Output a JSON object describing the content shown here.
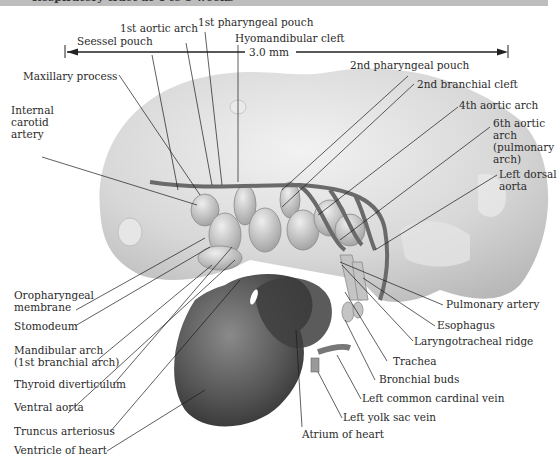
{
  "header": {
    "title": "Respiratory tract at 4 to 5 weeks"
  },
  "scale": {
    "label": "3.0 mm"
  },
  "labels": {
    "first_aortic_arch": "1st aortic arch",
    "first_pharyngeal_pouch": "1st pharyngeal pouch",
    "seessel_pouch": "Seessel pouch",
    "hyomandibular_cleft": "Hyomandibular cleft",
    "maxillary_process": "Maxillary process",
    "internal_carotid_artery": [
      "Internal",
      "carotid",
      "artery"
    ],
    "second_pharyngeal_pouch": "2nd pharyngeal pouch",
    "second_branchial_cleft": "2nd branchial cleft",
    "fourth_aortic_arch": "4th aortic arch",
    "sixth_aortic_arch": [
      "6th aortic",
      "arch",
      "(pulmonary",
      "arch)"
    ],
    "left_dorsal_aorta": [
      "Left dorsal",
      "aorta"
    ],
    "oropharyngeal_membrane": [
      "Oropharyngeal",
      "membrane"
    ],
    "stomodeum": "Stomodeum",
    "mandibular_arch": [
      "Mandibular arch",
      "(1st branchial arch)"
    ],
    "thyroid_diverticulum": "Thyroid diverticulum",
    "ventral_aorta": "Ventral aorta",
    "truncus_arteriosus": "Truncus arteriosus",
    "ventricle_of_heart": "Ventricle of heart",
    "pulmonary_artery": "Pulmonary artery",
    "esophagus": "Esophagus",
    "laryngotracheal_ridge": "Laryngotracheal ridge",
    "trachea": "Trachea",
    "bronchial_buds": "Bronchial buds",
    "left_common_cardinal_vein": "Left common cardinal vein",
    "left_yolk_sac_vein": "Left  yolk sac vein",
    "atrium_of_heart": "Atrium of heart"
  },
  "colors": {
    "header_bar": "#bdbdbd",
    "embryo": "#d9d9d9",
    "heart": "#4a4a4a",
    "leader": "#1a1a1a"
  }
}
